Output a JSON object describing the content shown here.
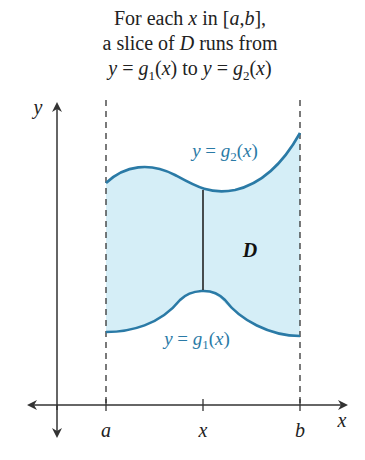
{
  "caption": {
    "line1": "For each x in [a,b],",
    "line2": "a slice of D runs from",
    "line3": "y = g1(x) to y = g2(x)"
  },
  "diagram": {
    "region_label": "D",
    "upper_curve_label": "y = g2(x)",
    "lower_curve_label": "y = g1(x)",
    "x_axis_label": "x",
    "y_axis_label": "y",
    "ticks": [
      "a",
      "x",
      "b"
    ],
    "colors": {
      "curve": "#2a7aa6",
      "region_fill": "#d5eef7",
      "axis": "#333333",
      "slice": "#222222"
    }
  }
}
